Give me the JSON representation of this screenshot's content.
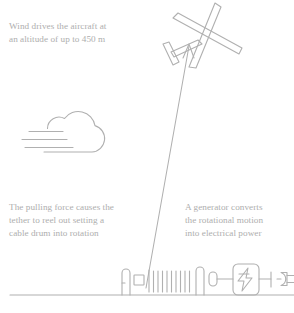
{
  "diagram": {
    "stroke_color": "#b0b0b0",
    "text_color": "#aeaeae",
    "background_color": "#ffffff"
  },
  "captions": {
    "wind": "Wind drives the aircraft at\nan altitude of up to 450 m",
    "tether": "The pulling force causes the\ntether to reel out setting a\ncable drum into rotation",
    "generator": "A generator converts\nthe rotational motion\ninto electrical power"
  },
  "elements": {
    "aircraft": "glider-aircraft",
    "cloud": "cloud-with-wind-lines",
    "tether": "tether-line-with-arrow",
    "drum": "cable-drum-winch",
    "generator": "generator-box-lightning",
    "plug": "electrical-plug",
    "ground": "ground-line"
  },
  "values": {
    "altitude": "450 m"
  }
}
